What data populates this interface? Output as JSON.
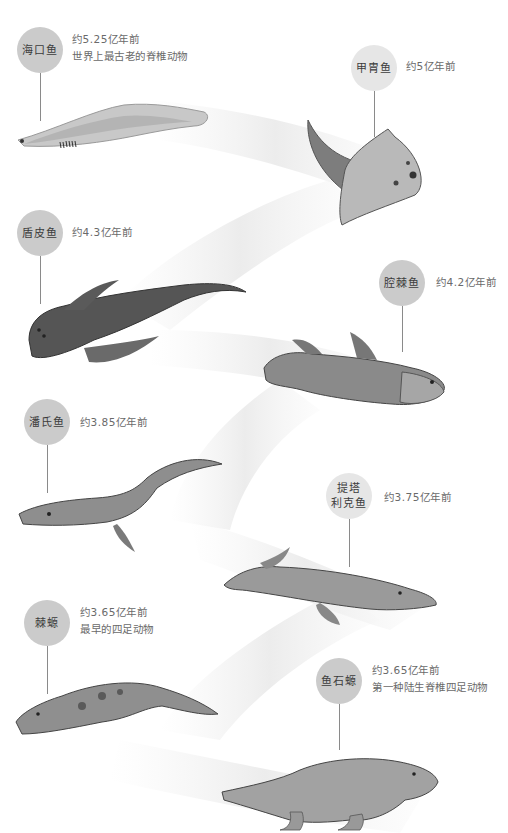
{
  "colors": {
    "circle_dark": "#cbcbcb",
    "circle_light": "#e6e6e6",
    "ribbon": "#ececec",
    "text": "#6a6a6a",
    "stem": "#8a8a8a"
  },
  "timeline": [
    {
      "name": "海口鱼",
      "date": "约5.25亿年前",
      "note": "世界上最古老的脊椎动物",
      "icon": "haikouichthys-illustration"
    },
    {
      "name": "甲胄鱼",
      "date": "约5亿年前",
      "note": "",
      "icon": "ostracoderm-illustration"
    },
    {
      "name": "盾皮鱼",
      "date": "约4.3亿年前",
      "note": "",
      "icon": "placoderm-illustration"
    },
    {
      "name": "腔棘鱼",
      "date": "约4.2亿年前",
      "note": "",
      "icon": "coelacanth-illustration"
    },
    {
      "name": "潘氏鱼",
      "date": "约3.85亿年前",
      "note": "",
      "icon": "panderichthys-illustration"
    },
    {
      "name_line1": "提塔",
      "name_line2": "利克鱼",
      "date": "约3.75亿年前",
      "note": "",
      "icon": "tiktaalik-illustration"
    },
    {
      "name": "棘螈",
      "date": "约3.65亿年前",
      "note": "最早的四足动物",
      "icon": "acanthostega-illustration"
    },
    {
      "name": "鱼石螈",
      "date": "约3.65亿年前",
      "note": "第一种陆生脊椎四足动物",
      "icon": "ichthyostega-illustration"
    }
  ]
}
